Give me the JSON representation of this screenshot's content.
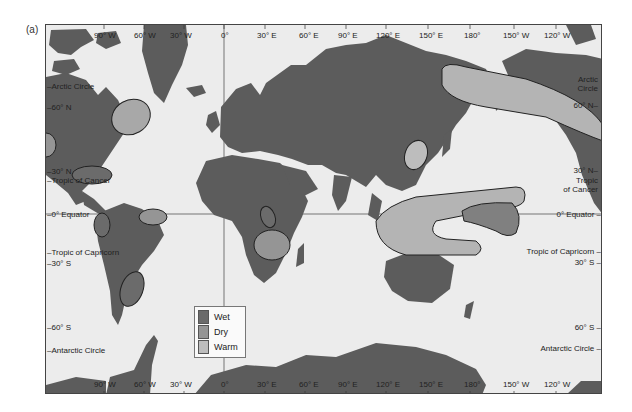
{
  "panel_label": "(a)",
  "map": {
    "top_longitudes": [
      "90° W",
      "60° W",
      "30° W",
      "0°",
      "30° E",
      "60° E",
      "90° E",
      "120° E",
      "150° E",
      "180°",
      "150° W",
      "120° W"
    ],
    "bottom_longitudes": [
      "90° W",
      "60° W",
      "30° W",
      "0°",
      "30° E",
      "60° E",
      "90° E",
      "120° E",
      "150° E",
      "180°",
      "150° W",
      "120° W"
    ],
    "left_latitudes": {
      "arctic": "Arctic Circle",
      "n60": "60° N",
      "n30": "30° N",
      "cancer": "Tropic of Cancer",
      "equator": "0° Equator",
      "capricorn": "Tropic of Capricorn",
      "s30": "30° S",
      "s60": "60° S",
      "antarctic": "Antarctic Circle"
    },
    "right_latitudes": {
      "arctic_1": "Arctic",
      "arctic_2": "Circle",
      "n60": "60° N",
      "n30": "30° N",
      "cancer_1": "Tropic",
      "cancer_2": "of Cancer",
      "equator": "0° Equator",
      "capricorn": "Tropic of Capricorn",
      "s30": "30° S",
      "s60": "60° S",
      "antarctic": "Antarctic Circle"
    }
  },
  "legend": {
    "items": [
      {
        "label": "Wet",
        "color": "#6b6b6b"
      },
      {
        "label": "Dry",
        "color": "#959595"
      },
      {
        "label": "Warm",
        "color": "#bdbdbd"
      }
    ]
  },
  "colors": {
    "land": "#5c5c5c",
    "ocean": "#ececec",
    "wet": "#6b6b6b",
    "dry": "#959595",
    "warm": "#bdbdbd"
  }
}
